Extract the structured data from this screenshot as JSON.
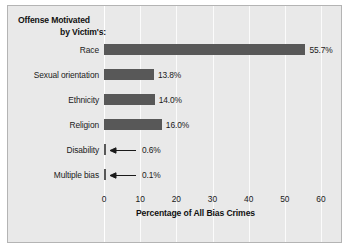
{
  "chart_data": {
    "type": "bar",
    "orientation": "horizontal",
    "title": "Offense Motivated by Victim's:",
    "title_line1": "Offense Motivated",
    "title_line2": "by Victim's:",
    "xlabel": "Percentage of All Bias Crimes",
    "ylabel": "",
    "categories": [
      "Race",
      "Sexual orientation",
      "Ethnicity",
      "Religion",
      "Disability",
      "Multiple bias"
    ],
    "values": [
      55.7,
      13.8,
      14.0,
      16.0,
      0.6,
      0.1
    ],
    "value_labels": [
      "55.7%",
      "13.8%",
      "14.0%",
      "16.0%",
      "0.6%",
      "0.1%"
    ],
    "xlim": [
      0,
      60
    ],
    "xticks": [
      0,
      10,
      20,
      30,
      40,
      50,
      60
    ],
    "xtick_labels": [
      "0",
      "10",
      "20",
      "30",
      "40",
      "50",
      "60"
    ],
    "grid": true,
    "grid_axis": "x",
    "legend": "none",
    "annotations": [
      {
        "category": "Disability",
        "style": "leader-arrow",
        "text": "0.6%"
      },
      {
        "category": "Multiple bias",
        "style": "leader-arrow",
        "text": "0.1%"
      }
    ],
    "colors": {
      "bar": "#585858",
      "panel_background": "#e9e9e9",
      "page_background": "#ffffff",
      "gridline": "#fbfbfb",
      "axis_line": "#ffffff",
      "text": "#1a1a1a",
      "border": "#b4b4b4"
    }
  }
}
